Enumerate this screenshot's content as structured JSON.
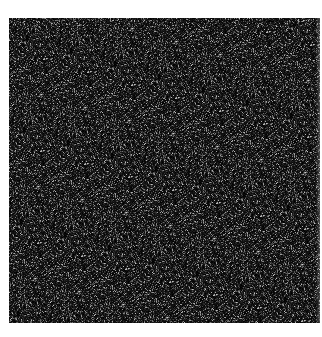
{
  "image": {
    "description": "Square field of grayscale random noise on white background",
    "background_color": "#ffffff",
    "noise": {
      "x": 9,
      "y": 18,
      "width": 311,
      "height": 305,
      "base_color": "#1a1a1a",
      "min_gray": 0,
      "max_gray": 200,
      "density": 0.55
    }
  }
}
